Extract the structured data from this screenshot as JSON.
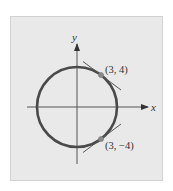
{
  "figure": {
    "colors": {
      "background": "#ffffff",
      "panel": "#e9e9e9",
      "panel_border": "#d2d2d2",
      "circle": "#4a4a4a",
      "axes": "#555555",
      "tangent": "#555555",
      "point": "#8a8a8a",
      "text": "#333333"
    },
    "axes": {
      "x_label": "x",
      "y_label": "y"
    },
    "circle": {
      "center": [
        0,
        0
      ],
      "radius": 5
    },
    "points": [
      {
        "coords": [
          3,
          4
        ],
        "label": "(3, 4)",
        "tangent_slope": -0.75
      },
      {
        "coords": [
          3,
          -4
        ],
        "label": "(3, −4)",
        "tangent_slope": 0.75
      }
    ]
  }
}
